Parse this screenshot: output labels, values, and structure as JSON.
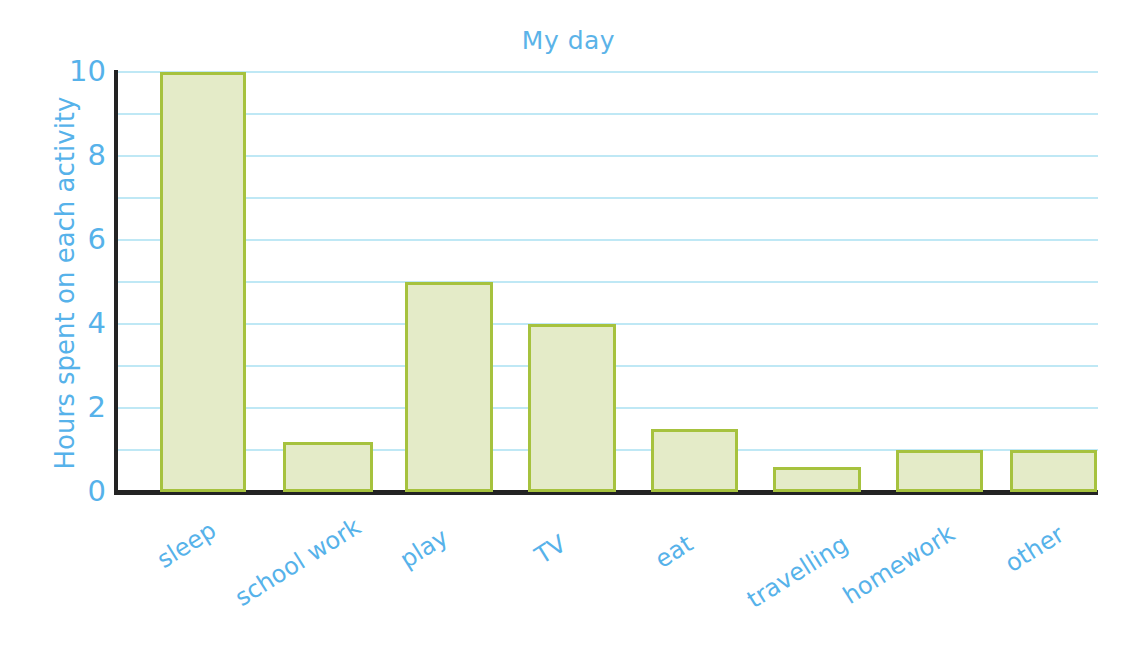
{
  "chart_data": {
    "type": "bar",
    "title": "My day",
    "xlabel": "",
    "ylabel": "Hours spent on each activity",
    "categories": [
      "sleep",
      "school work",
      "play",
      "TV",
      "eat",
      "travelling",
      "homework",
      "other"
    ],
    "values": [
      10,
      1.2,
      5,
      4,
      1.5,
      0.6,
      1,
      1
    ],
    "ylim": [
      0,
      10
    ],
    "yticks": [
      "0",
      "2",
      "4",
      "6",
      "8",
      "10"
    ],
    "ytick_values": [
      0,
      2,
      4,
      6,
      8,
      10
    ],
    "gridlines": [
      1,
      2,
      3,
      4,
      5,
      6,
      7,
      8,
      9,
      10
    ],
    "grid": true,
    "legend": "none",
    "colors": {
      "bar_fill": "#e4ebc8",
      "bar_border": "#a6c23e",
      "gridline": "#bfe8f5",
      "axis": "#232323",
      "text": "#56b2ea",
      "title": "#5bb3e8",
      "background": "#ffffff"
    }
  }
}
